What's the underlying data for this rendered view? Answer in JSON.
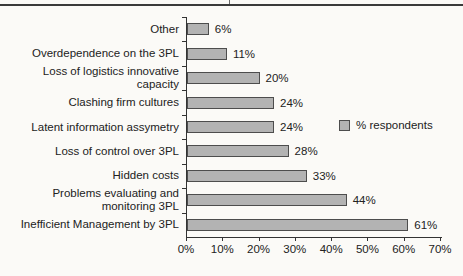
{
  "chart_data": {
    "type": "bar",
    "orientation": "horizontal",
    "title": "",
    "xlabel": "",
    "ylabel": "",
    "categories": [
      "Other",
      "Overdependence on the 3PL",
      "Loss of logistics innovative\ncapacity",
      "Clashing firm cultures",
      "Latent information assymetry",
      "Loss of control over 3PL",
      "Hidden costs",
      "Problems evaluating and\nmonitoring 3PL",
      "Inefficient Management by 3PL"
    ],
    "values": [
      6,
      11,
      20,
      24,
      24,
      28,
      33,
      44,
      61
    ],
    "value_labels": [
      "6%",
      "11%",
      "20%",
      "24%",
      "24%",
      "28%",
      "33%",
      "44%",
      "61%"
    ],
    "x_ticks": [
      "0%",
      "10%",
      "20%",
      "30%",
      "40%",
      "50%",
      "60%",
      "70%"
    ],
    "xlim": [
      0,
      70
    ],
    "grid": false,
    "legend": {
      "label": "% respondents",
      "position": "right-middle"
    },
    "style": {
      "bar_fill": "#b3b3b3",
      "bar_border": "#4d4d4d",
      "axis_color": "#333333",
      "text_color": "#222222",
      "background": "#fbfaf7"
    }
  }
}
